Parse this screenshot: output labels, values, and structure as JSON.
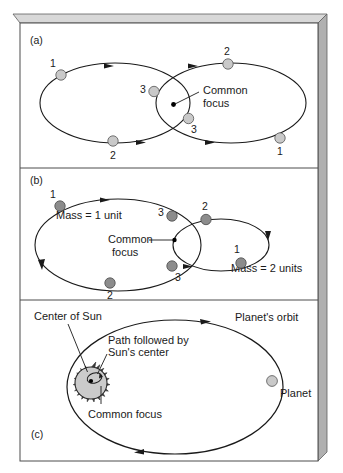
{
  "figure": {
    "frame": {
      "face_color": "#ffffff",
      "edge_color": "#4d4d4d",
      "bevel_light": "#d8d8d8",
      "bevel_dark": "#a8a8a8"
    },
    "colors": {
      "stroke": "#1a1a1a",
      "body_light": "#c9c9c9",
      "body_dark": "#8c8c8c",
      "sun_fill": "#cccccc",
      "focus_dot": "#000000"
    }
  },
  "panels": [
    {
      "id": "a",
      "label": "(a)",
      "description": "Two equal-mass bodies on equal ellipses sharing a common focus",
      "body_fill": "#c9c9c9",
      "annotations": [
        {
          "name": "common-focus",
          "text": "Common",
          "text2": "focus"
        }
      ],
      "markers": [
        {
          "name": "left-body-pos-1",
          "label": "1"
        },
        {
          "name": "left-body-pos-2",
          "label": "2"
        },
        {
          "name": "left-body-pos-3",
          "label": "3"
        },
        {
          "name": "right-body-pos-1",
          "label": "1"
        },
        {
          "name": "right-body-pos-2",
          "label": "2"
        },
        {
          "name": "right-body-pos-3",
          "label": "3"
        }
      ]
    },
    {
      "id": "b",
      "label": "(b)",
      "description": "Unequal masses: the 1-unit mass traces the larger ellipse, the 2-unit mass the smaller",
      "body_fill": "#8c8c8c",
      "annotations": [
        {
          "name": "mass-1-label",
          "text": "Mass = 1 unit"
        },
        {
          "name": "mass-2-label",
          "text": "Mass = 2 units"
        },
        {
          "name": "common-focus",
          "text": "Common",
          "text2": "focus"
        }
      ],
      "markers": [
        {
          "name": "left-body-pos-1",
          "label": "1"
        },
        {
          "name": "left-body-pos-2",
          "label": "2"
        },
        {
          "name": "left-body-pos-3",
          "label": "3"
        },
        {
          "name": "right-body-pos-1",
          "label": "1"
        },
        {
          "name": "right-body-pos-2",
          "label": "2"
        },
        {
          "name": "right-body-pos-3",
          "label": "3"
        }
      ]
    },
    {
      "id": "c",
      "label": "(c)",
      "description": "Sun and planet: the Sun's center traces a tiny loop about the common focus",
      "annotations": [
        {
          "name": "center-of-sun-label",
          "text": "Center of Sun"
        },
        {
          "name": "sun-path-label",
          "text": "Path followed by",
          "text2": "Sun's center"
        },
        {
          "name": "common-focus-label",
          "text": "Common focus"
        },
        {
          "name": "planet-orbit-label",
          "text": "Planet's orbit"
        },
        {
          "name": "planet-label",
          "text": "Planet"
        }
      ]
    }
  ],
  "labels": {
    "panel_a": "(a)",
    "panel_b": "(b)",
    "panel_c": "(c)",
    "common": "Common",
    "focus": "focus",
    "common_hyphen": "Common-",
    "common_focus": "Common focus",
    "mass_1": "Mass = 1 unit",
    "mass_2": "Mass = 2 units",
    "center_of_sun": "Center of Sun",
    "path_followed_by": "Path followed by",
    "suns_center": "Sun's center",
    "planets_orbit": "Planet's orbit",
    "planet": "Planet",
    "n1": "1",
    "n2": "2",
    "n3": "3"
  }
}
